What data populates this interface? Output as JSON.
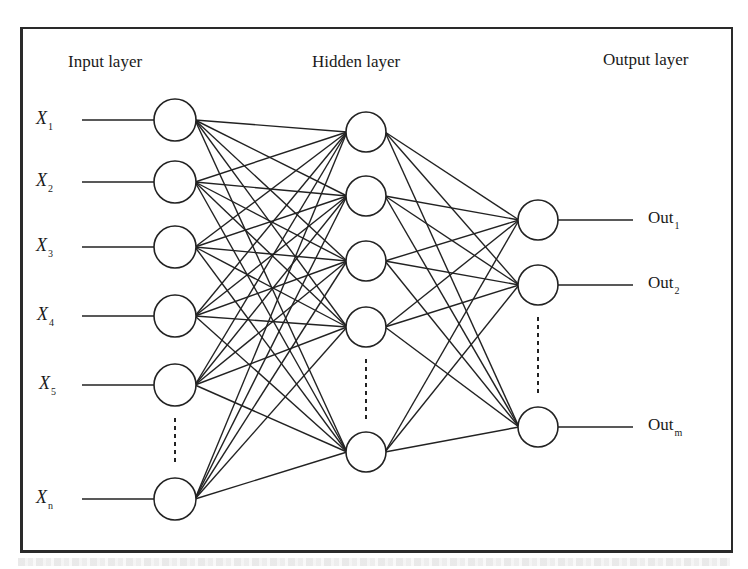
{
  "diagram": {
    "type": "neural-network",
    "layers": {
      "input": {
        "title": "Input layer",
        "labels": [
          {
            "base": "X",
            "sub": "1"
          },
          {
            "base": "X",
            "sub": "2"
          },
          {
            "base": "X",
            "sub": "3"
          },
          {
            "base": "X",
            "sub": "4"
          },
          {
            "base": "X",
            "sub": "5"
          },
          {
            "base": "X",
            "sub": "n"
          }
        ],
        "node_cx": 175,
        "node_r": 21,
        "node_cy": [
          120,
          182,
          247,
          316,
          385,
          499
        ],
        "ellipsis_between": [
          4,
          5
        ]
      },
      "hidden": {
        "title": "Hidden layer",
        "node_cx": 366,
        "node_r": 20,
        "node_cy": [
          132,
          196,
          261,
          327,
          452
        ],
        "ellipsis_between": [
          3,
          4
        ]
      },
      "output": {
        "title": "Output layer",
        "labels": [
          {
            "base": "Out",
            "sub": "1"
          },
          {
            "base": "Out",
            "sub": "2"
          },
          {
            "base": "Out",
            "sub": "m"
          }
        ],
        "node_cx": 538,
        "node_r": 20,
        "node_cy": [
          220,
          285,
          427
        ],
        "ellipsis_between": [
          1,
          2
        ]
      }
    },
    "connectivity": "fully-connected",
    "colors": {
      "stroke": "#222222",
      "background": "#ffffff",
      "frame": "#2a2a2a"
    }
  }
}
